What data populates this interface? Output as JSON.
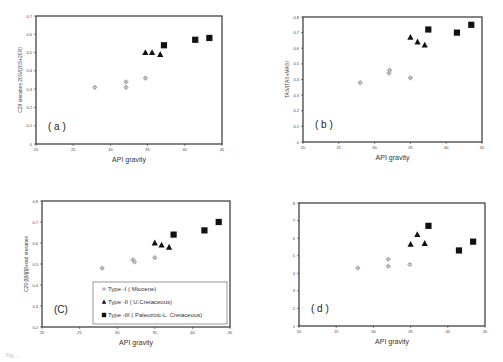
{
  "figure": {
    "x_axis_label": "API gravity",
    "caption_fragment": "Fig. ..."
  },
  "legend": [
    {
      "marker": "diamond",
      "label": "Type -I ( Miocene)"
    },
    {
      "marker": "triangle",
      "label": "Type -II ( U.Cretaceous)"
    },
    {
      "marker": "square",
      "label": "Type -III ( Paleozoic-L. Cretaceous)"
    }
  ],
  "chart_data": [
    {
      "type": "scatter",
      "panel": "(a)",
      "title": "",
      "xlabel": "API gravity",
      "ylabel": "C29 steranes 20S/(20S+20R)",
      "xlim": [
        20,
        45
      ],
      "ylim": [
        0,
        0.7
      ],
      "xticks": [
        20,
        25,
        30,
        35,
        40,
        45
      ],
      "yticks": [
        0,
        0.1,
        0.2,
        0.3,
        0.4,
        0.5,
        0.6,
        0.7
      ],
      "series": [
        {
          "name": "Type -I ( Miocene)",
          "marker": "diamond",
          "points": [
            [
              27.9,
              0.31
            ],
            [
              32.1,
              0.34
            ],
            [
              32.1,
              0.31
            ],
            [
              34.7,
              0.36
            ]
          ]
        },
        {
          "name": "Type -II ( U.Cretaceous)",
          "marker": "triangle",
          "points": [
            [
              34.7,
              0.5
            ],
            [
              35.6,
              0.5
            ],
            [
              36.7,
              0.49
            ]
          ]
        },
        {
          "name": "Type -III ( Paleozoic-L. Cretaceous)",
          "marker": "square",
          "points": [
            [
              37.2,
              0.54
            ],
            [
              41.4,
              0.57
            ],
            [
              43.3,
              0.58
            ]
          ]
        }
      ]
    },
    {
      "type": "scatter",
      "panel": "(b)",
      "title": "",
      "xlabel": "API gravity",
      "ylabel": "TAS/(TAS+MAS)",
      "xlim": [
        20,
        45
      ],
      "ylim": [
        0,
        0.8
      ],
      "xticks": [
        20,
        25,
        30,
        35,
        40,
        45
      ],
      "yticks": [
        0,
        0.1,
        0.2,
        0.3,
        0.4,
        0.5,
        0.6,
        0.7,
        0.8
      ],
      "series": [
        {
          "name": "Type -I ( Miocene)",
          "marker": "diamond",
          "points": [
            [
              28.0,
              0.38
            ],
            [
              32.0,
              0.44
            ],
            [
              32.1,
              0.46
            ],
            [
              35.0,
              0.41
            ]
          ]
        },
        {
          "name": "Type -II ( U.Cretaceous)",
          "marker": "triangle",
          "points": [
            [
              35.0,
              0.67
            ],
            [
              36.0,
              0.64
            ],
            [
              37.0,
              0.62
            ]
          ]
        },
        {
          "name": "Type -III ( Paleozoic-L. Cretaceous)",
          "marker": "square",
          "points": [
            [
              37.5,
              0.72
            ],
            [
              41.5,
              0.7
            ],
            [
              43.5,
              0.75
            ]
          ]
        }
      ]
    },
    {
      "type": "scatter",
      "panel": "(C)",
      "title": "",
      "xlabel": "API gravity",
      "ylabel": "C29 ββ/(ββ+αα) steranes",
      "xlim": [
        20,
        45
      ],
      "ylim": [
        0.2,
        0.8
      ],
      "xticks": [
        20,
        25,
        30,
        35,
        40,
        45
      ],
      "yticks": [
        0.2,
        0.3,
        0.4,
        0.5,
        0.6,
        0.7,
        0.8
      ],
      "series": [
        {
          "name": "Type -I ( Miocene)",
          "marker": "diamond",
          "points": [
            [
              28.0,
              0.48
            ],
            [
              32.1,
              0.52
            ],
            [
              32.3,
              0.51
            ],
            [
              35.0,
              0.53
            ]
          ]
        },
        {
          "name": "Type -II ( U.Cretaceous)",
          "marker": "triangle",
          "points": [
            [
              35.0,
              0.6
            ],
            [
              35.9,
              0.59
            ],
            [
              36.9,
              0.58
            ]
          ]
        },
        {
          "name": "Type -III ( Paleozoic-L. Cretaceous)",
          "marker": "square",
          "points": [
            [
              37.5,
              0.64
            ],
            [
              41.6,
              0.66
            ],
            [
              43.5,
              0.7
            ]
          ]
        }
      ]
    },
    {
      "type": "scatter",
      "panel": "(d)",
      "title": "",
      "xlabel": "API gravity",
      "ylabel": "",
      "xlim": [
        20,
        45
      ],
      "ylim": [
        1,
        8
      ],
      "xticks": [
        20,
        25,
        30,
        35,
        40,
        45
      ],
      "yticks": [
        1,
        2,
        3,
        4,
        5,
        6,
        7,
        8
      ],
      "series": [
        {
          "name": "Type -I ( Miocene)",
          "marker": "diamond",
          "points": [
            [
              27.9,
              4.3
            ],
            [
              32.0,
              4.8
            ],
            [
              32.0,
              4.4
            ],
            [
              34.9,
              4.5
            ]
          ]
        },
        {
          "name": "Type -II ( U.Cretaceous)",
          "marker": "triangle",
          "points": [
            [
              35.0,
              5.65
            ],
            [
              35.9,
              6.2
            ],
            [
              36.9,
              5.7
            ]
          ]
        },
        {
          "name": "Type -III ( Paleozoic-L. Cretaceous)",
          "marker": "square",
          "points": [
            [
              37.4,
              6.7
            ],
            [
              41.5,
              5.3
            ],
            [
              43.4,
              5.8
            ]
          ]
        }
      ]
    }
  ]
}
